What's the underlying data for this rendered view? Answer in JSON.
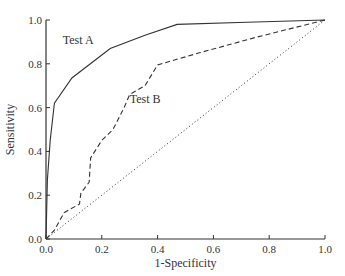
{
  "chart_data": {
    "type": "line",
    "title": "",
    "xlabel": "1-Specificity",
    "ylabel": "Sensitivity",
    "xlim": [
      0,
      1
    ],
    "ylim": [
      0,
      1
    ],
    "xticks": [
      "0.0",
      "0.2",
      "0.4",
      "0.6",
      "0.8",
      "1.0"
    ],
    "yticks": [
      "0.0",
      "0.2",
      "0.4",
      "0.6",
      "0.8",
      "1.0"
    ],
    "grid": false,
    "series": [
      {
        "name": "Test A",
        "style": "solid",
        "x": [
          0.0,
          0.005,
          0.015,
          0.03,
          0.093,
          0.23,
          0.355,
          0.47,
          0.72,
          1.0
        ],
        "y": [
          0.0,
          0.27,
          0.45,
          0.62,
          0.735,
          0.87,
          0.93,
          0.98,
          0.99,
          1.0
        ]
      },
      {
        "name": "Test B",
        "style": "dashed",
        "x": [
          0.0,
          0.03,
          0.065,
          0.12,
          0.125,
          0.155,
          0.16,
          0.2,
          0.24,
          0.28,
          0.3,
          0.355,
          0.4,
          0.55,
          0.75,
          1.0
        ],
        "y": [
          0.0,
          0.04,
          0.12,
          0.16,
          0.21,
          0.26,
          0.37,
          0.45,
          0.5,
          0.6,
          0.66,
          0.7,
          0.795,
          0.85,
          0.92,
          1.0
        ]
      },
      {
        "name": "Chance",
        "style": "dotted",
        "x": [
          0.0,
          1.0
        ],
        "y": [
          0.0,
          1.0
        ]
      }
    ],
    "annotations": [
      {
        "text": "Test A",
        "x": 0.06,
        "y": 0.89
      },
      {
        "text": "Test B",
        "x": 0.3,
        "y": 0.62
      }
    ]
  }
}
